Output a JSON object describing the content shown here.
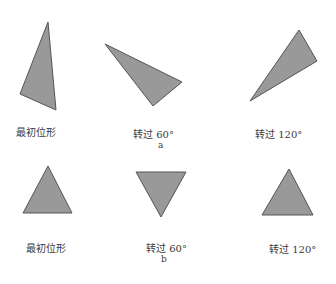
{
  "figure": {
    "fill_color": "#999999",
    "stroke_color": "#555555",
    "rows": [
      {
        "caption": "a",
        "items": [
          {
            "label": "最初位形",
            "points": "48,22 56,110 20,94"
          },
          {
            "label": "转过 60°",
            "points": "105,44 182,82 153,106"
          },
          {
            "label": "转过 120°",
            "points": "299,30 317,61 250,101"
          }
        ]
      },
      {
        "caption": "b",
        "items": [
          {
            "label": "最初位形",
            "points": "48,166 72,213 23,213"
          },
          {
            "label": "转过 60°",
            "points": "136,172 186,172 161,217"
          },
          {
            "label": "转过 120°",
            "points": "289,169 313,215 262,215"
          }
        ]
      }
    ]
  }
}
